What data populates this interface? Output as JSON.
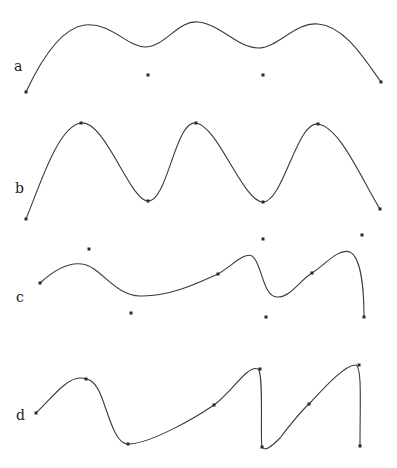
{
  "figure": {
    "panels": [
      {
        "label": "a",
        "description": "Smooth curve with three peaks, control points off-curve",
        "curve_points": [
          [
            26,
            92
          ],
          [
            85,
            25
          ],
          [
            145,
            47
          ],
          [
            198,
            22
          ],
          [
            258,
            47
          ],
          [
            318,
            24
          ],
          [
            381,
            82
          ]
        ],
        "markers": [
          [
            26,
            92
          ],
          [
            148,
            75
          ],
          [
            263,
            75
          ],
          [
            381,
            82
          ]
        ]
      },
      {
        "label": "b",
        "description": "Interpolating curve passing through all points, three peaks two troughs",
        "curve_points": [
          [
            26,
            219
          ],
          [
            81,
            123
          ],
          [
            148,
            201
          ],
          [
            196,
            123
          ],
          [
            263,
            202
          ],
          [
            318,
            124
          ],
          [
            380,
            209
          ]
        ],
        "markers": [
          [
            26,
            219
          ],
          [
            81,
            123
          ],
          [
            148,
            201
          ],
          [
            196,
            123
          ],
          [
            263,
            202
          ],
          [
            318,
            124
          ],
          [
            380,
            209
          ]
        ]
      },
      {
        "label": "c",
        "description": "Irregular curve with scattered control points",
        "curve_points": [
          [
            40,
            283
          ],
          [
            82,
            264
          ],
          [
            140,
            296
          ],
          [
            218,
            274
          ],
          [
            250,
            256
          ],
          [
            277,
            297
          ],
          [
            312,
            273
          ],
          [
            346,
            252
          ],
          [
            364,
            317
          ]
        ],
        "markers": [
          [
            40,
            283
          ],
          [
            89,
            249
          ],
          [
            131,
            313
          ],
          [
            218,
            274
          ],
          [
            263,
            239
          ],
          [
            266,
            317
          ],
          [
            312,
            273
          ],
          [
            362,
            235
          ],
          [
            364,
            317
          ]
        ]
      },
      {
        "label": "d",
        "description": "Interpolating curve with sharp vertical drops",
        "curve_points": [
          [
            36,
            413
          ],
          [
            86,
            379
          ],
          [
            128,
            444
          ],
          [
            214,
            405
          ],
          [
            260,
            369
          ],
          [
            262,
            447
          ],
          [
            309,
            404
          ],
          [
            359,
            365
          ],
          [
            360,
            446
          ]
        ],
        "markers": [
          [
            36,
            413
          ],
          [
            86,
            379
          ],
          [
            128,
            444
          ],
          [
            214,
            405
          ],
          [
            260,
            369
          ],
          [
            262,
            447
          ],
          [
            309,
            404
          ],
          [
            359,
            365
          ],
          [
            360,
            446
          ]
        ]
      }
    ]
  }
}
